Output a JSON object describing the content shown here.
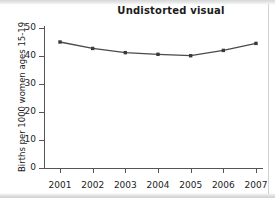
{
  "chart_data": {
    "type": "line",
    "title": "Undistorted visual",
    "xlabel": "",
    "ylabel": "Births per 1000 women ages 15-19",
    "categories": [
      "2001",
      "2002",
      "2003",
      "2004",
      "2005",
      "2006",
      "2007"
    ],
    "x": [
      2001,
      2002,
      2003,
      2004,
      2005,
      2006,
      2007
    ],
    "values": [
      45.0,
      42.7,
      41.2,
      40.6,
      40.1,
      42.0,
      44.5
    ],
    "series": [
      {
        "name": "Births per 1000 women ages 15-19",
        "values": [
          45.0,
          42.7,
          41.2,
          40.6,
          40.1,
          42.0,
          44.5
        ]
      }
    ],
    "ylim": [
      0,
      50
    ],
    "yticks": [
      0,
      10,
      20,
      30,
      40,
      50
    ],
    "ytick_labels": [
      "0",
      "10",
      "20",
      "30",
      "40",
      "50"
    ],
    "xtick_labels": [
      "2001",
      "2002",
      "2003",
      "2004",
      "2005",
      "2006",
      "2007"
    ],
    "grid": false,
    "legend": false,
    "legend_position": "none",
    "line_color": "#4a4a4a",
    "marker_color": "#3a3a3a",
    "marker": "square",
    "axis_color": "#555555",
    "background_color": "#ffffff"
  }
}
